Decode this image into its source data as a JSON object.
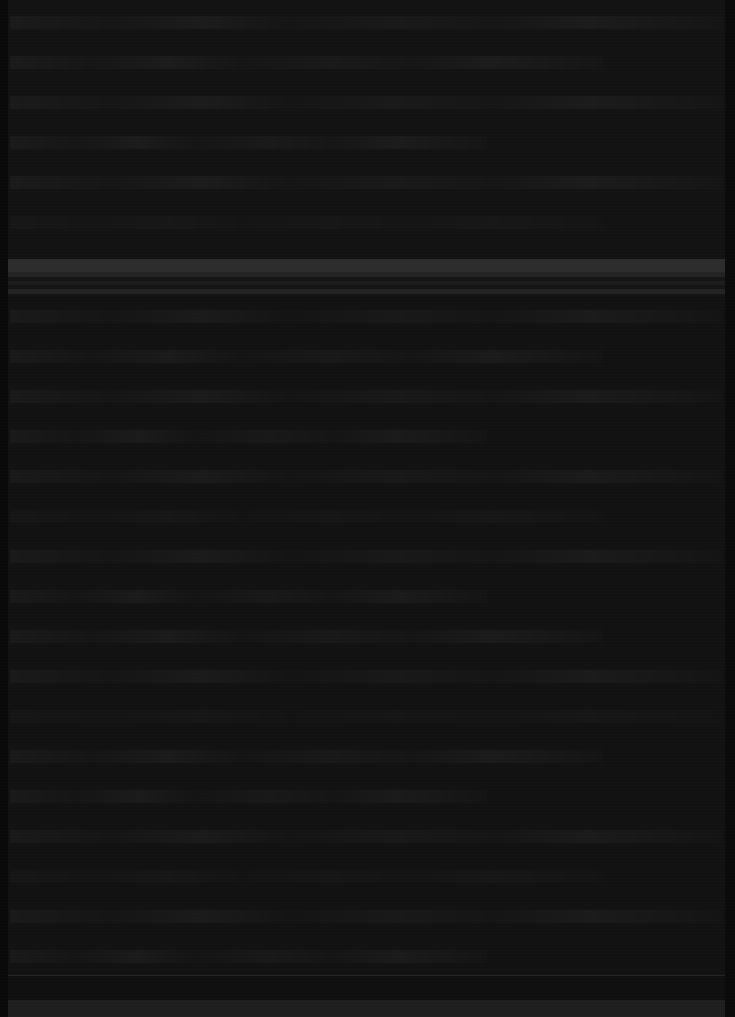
{
  "capture": {
    "width": 735,
    "height": 1017,
    "description": "Severely underexposed near-black UI screenshot; no text or iconography is legible at any magnification.",
    "legibility": "none",
    "peak_luminance_hex": "#2a2a2a",
    "base_background_hex": "#0d0d0d"
  },
  "colors": {
    "background": "#0d0d0d",
    "content_fill": "#111111",
    "header_bar": "#2a2a2a",
    "toolbar_stripe": "#212121",
    "toolbar_stripe_faint": "#1a1a1a",
    "divider": "#232323",
    "footer_bar": "#1c1c1c",
    "gutter_left": "#070707",
    "gutter_right": "#080808",
    "text_ghost": "rgba(255,255,255,0.035)"
  },
  "regions": [
    {
      "name": "top-content-block",
      "y": 0,
      "height": 258,
      "kind": "text-rows",
      "row_pitch": 40,
      "note": "Faint repeating text-like rows, full width."
    },
    {
      "name": "header-bar",
      "y": 259,
      "height": 13,
      "kind": "solid-band",
      "note": "Brightest element in the capture; spans full width."
    },
    {
      "name": "toolbar-band-group",
      "y": 272,
      "height": 24,
      "kind": "stacked-stripes",
      "stripe_count": 3,
      "note": "Two to three thin horizontal stripes directly below the header bar."
    },
    {
      "name": "main-body",
      "y": 296,
      "height": 679,
      "kind": "text-rows",
      "row_pitch": 40,
      "note": "Uniform repeating faint rows spanning full width; no vertical sidebar divider present."
    },
    {
      "name": "footer-divider",
      "y": 975,
      "height": 1,
      "kind": "separator"
    },
    {
      "name": "footer-strip",
      "y": 1000,
      "height": 17,
      "kind": "solid-band",
      "note": "Slightly lighter bottom bar."
    },
    {
      "name": "gutter-left",
      "x": 0,
      "width": 8,
      "kind": "vertical-margin"
    },
    {
      "name": "gutter-right",
      "x": 725,
      "width": 10,
      "kind": "vertical-margin"
    }
  ],
  "absent_features": {
    "window_controls": false,
    "sidebar_divider": false,
    "legible_text": false,
    "legible_icons": false
  }
}
